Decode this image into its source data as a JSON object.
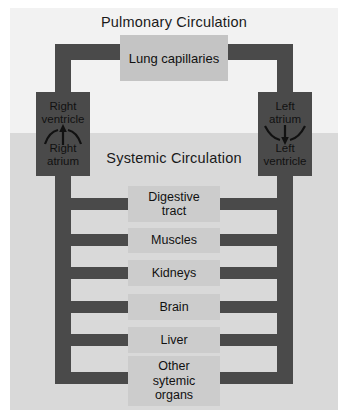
{
  "figure": {
    "background_color": "#f2f2f2",
    "systemic_band_color": "#d9d9d9",
    "vessel_color": "#4a4a4a",
    "organ_color": "#cccccc",
    "lung_color": "#c4c4c4"
  },
  "titles": {
    "pulmonary": "Pulmonary Circulation",
    "systemic": "Systemic Circulation"
  },
  "lung": {
    "line1": "Lung",
    "line2": "capillaries"
  },
  "heart": {
    "right": {
      "top_line1": "Right",
      "top_line2": "ventricle",
      "bottom_line1": "Right",
      "bottom_line2": "atrium",
      "flow_direction": "up"
    },
    "left": {
      "top_line1": "Left",
      "top_line2": "atrium",
      "bottom_line1": "Left",
      "bottom_line2": "ventricle",
      "flow_direction": "down"
    }
  },
  "organs": [
    {
      "line1": "Digestive",
      "line2": "tract"
    },
    {
      "line1": "Muscles",
      "line2": ""
    },
    {
      "line1": "Kidneys",
      "line2": ""
    },
    {
      "line1": "Brain",
      "line2": ""
    },
    {
      "line1": "Liver",
      "line2": ""
    },
    {
      "line1": "Other",
      "line2": "sytemic",
      "line3": "organs"
    }
  ]
}
